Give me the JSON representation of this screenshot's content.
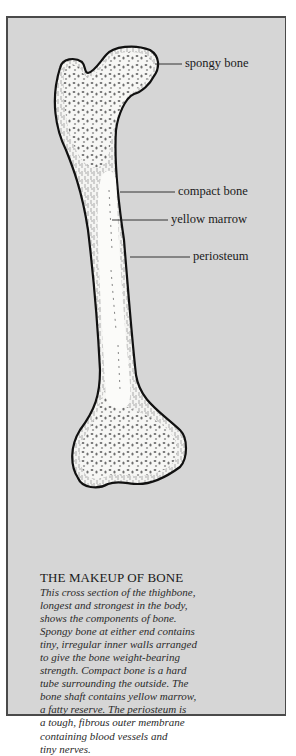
{
  "figure": {
    "labels": {
      "spongy_bone": "spongy bone",
      "compact_bone": "compact bone",
      "yellow_marrow": "yellow marrow",
      "periosteum": "periosteum"
    },
    "colors": {
      "panel": "#d6d6d6",
      "border": "#4a4a4a",
      "bone": "#f7f7f5",
      "spongy": "#6e6e6e"
    }
  },
  "caption": {
    "title": "THE MAKEUP OF BONE",
    "lines": [
      "This cross section of the thighbone,",
      "longest and strongest in the body,",
      "shows the components of bone.",
      "Spongy bone at either end contains",
      "tiny, irregular inner walls arranged",
      "to give the bone weight-bearing",
      "strength. Compact bone is a hard",
      "tube surrounding the outside. The",
      "bone shaft contains yellow marrow,",
      "a fatty reserve. The periosteum is",
      "a tough, fibrous outer membrane",
      "containing blood vessels and",
      "tiny nerves."
    ]
  }
}
